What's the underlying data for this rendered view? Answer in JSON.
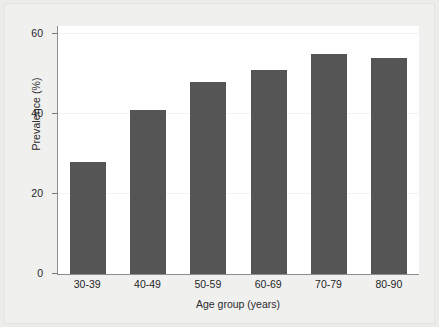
{
  "chart_data": {
    "type": "bar",
    "title": "",
    "xlabel": "Age group (years)",
    "ylabel": "Prevalence (%)",
    "categories": [
      "30-39",
      "40-49",
      "50-59",
      "60-69",
      "70-79",
      "80-90"
    ],
    "values": [
      28,
      41,
      48,
      51,
      55,
      54
    ],
    "series": [
      {
        "name": "Prevalence",
        "values": [
          28,
          41,
          48,
          51,
          55,
          54
        ]
      }
    ],
    "ylim": [
      0,
      62
    ],
    "yticks": [
      0,
      20,
      40,
      60
    ],
    "ytick_labels": [
      "0",
      "20",
      "40",
      "60"
    ],
    "grid": true,
    "legend": "none",
    "bar_color": "#555555",
    "plot_background": "#ffffff",
    "page_background": "#ececeb",
    "axis_color": "#8d8d8d"
  }
}
